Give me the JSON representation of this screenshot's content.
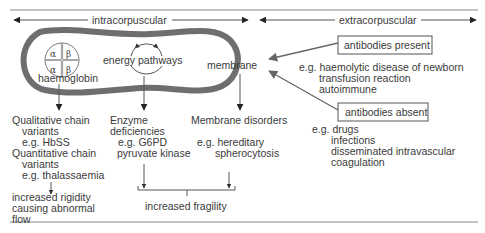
{
  "header": {
    "intracorpuscular": "intracorpuscular",
    "extracorpuscular": "extracorpuscular"
  },
  "cell": {
    "haemoglobin": {
      "label": "haemoglobin",
      "chains": [
        "α",
        "β",
        "α",
        "β"
      ]
    },
    "energy_pathways": "energy pathways",
    "membrane": "membrane"
  },
  "haemoglobin_branch": {
    "lines": [
      "Qualitative chain",
      "variants",
      "e.g. HbSS",
      "Quantitative chain",
      "variants",
      "e.g. thalassaemia"
    ],
    "outcome": [
      "increased rigidity",
      "causing abnormal",
      "flow"
    ]
  },
  "enzyme_branch": {
    "lines": [
      "Enzyme",
      "deficiencies",
      "e.g. G6PD",
      "pyruvate kinase"
    ]
  },
  "membrane_branch": {
    "lines": [
      "Membrane disorders",
      "e.g. hereditary",
      "spherocytosis"
    ]
  },
  "shared_outcome": "increased fragility",
  "extracorpuscular": {
    "antibodies_present": {
      "label": "antibodies present",
      "examples": [
        "e.g. haemolytic disease of newborn",
        "transfusion reaction",
        "autoimmune"
      ]
    },
    "antibodies_absent": {
      "label": "antibodies absent",
      "examples": [
        "e.g. drugs",
        "infections",
        "disseminated intravascular",
        "coagulation"
      ]
    }
  }
}
